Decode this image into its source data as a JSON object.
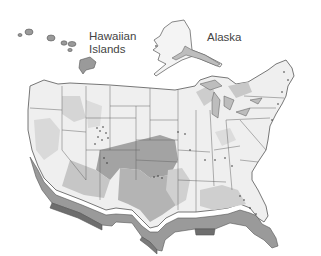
{
  "map": {
    "type": "choropleth",
    "region": "United States",
    "labels": {
      "hawaii": "Hawaiian Islands",
      "hawaii_line1": "Hawaiian",
      "hawaii_line2": "Islands",
      "alaska": "Alaska"
    },
    "colors": {
      "background": "#ffffff",
      "land_light": "#efefef",
      "shade_light": "#d9d9d9",
      "shade_medium": "#bdbdbd",
      "shade_dark": "#a3a3a3",
      "extrusion": "#8c8c8c",
      "extrusion_dark": "#6e6e6e",
      "border": "#555555"
    },
    "shaded_regions": [
      "Great Plains (Kansas, Oklahoma, Texas, eastern Colorado, New Mexico)",
      "Southwest (Arizona, southern California)",
      "Gulf Coast",
      "Georgia / Florida",
      "Pacific Northwest interior"
    ]
  }
}
